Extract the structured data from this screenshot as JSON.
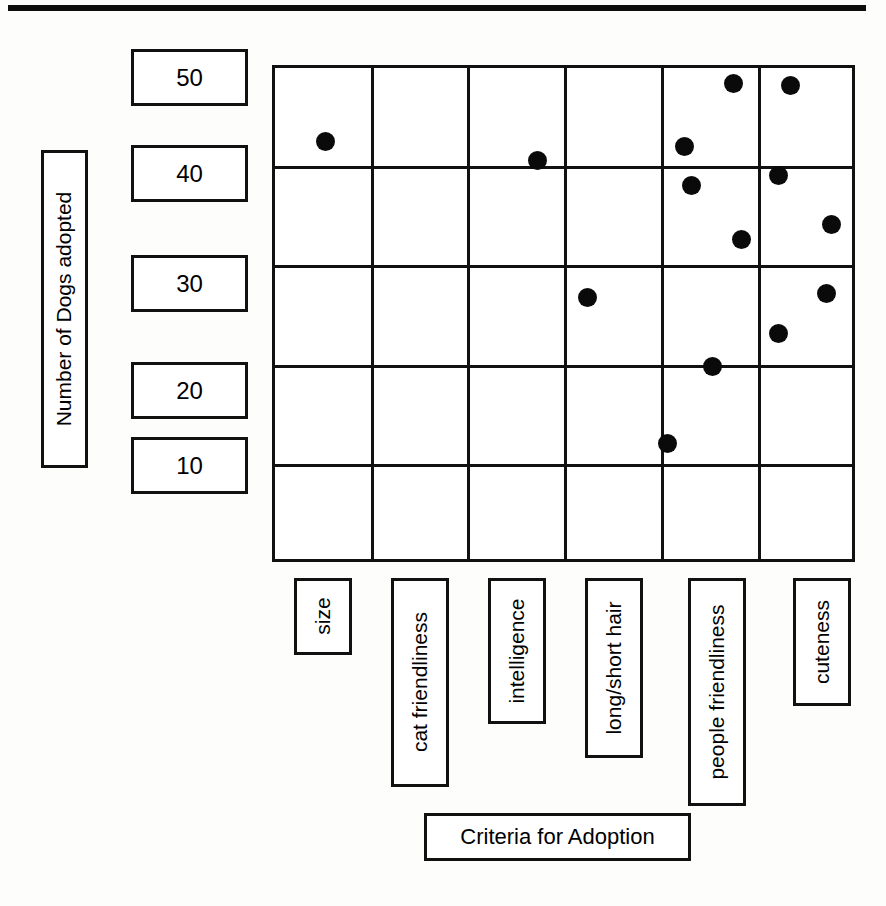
{
  "page": {
    "background_color": "#fdfdfc",
    "ink_color": "#111111"
  },
  "chart_data": {
    "type": "scatter",
    "title": "",
    "xlabel": "Criteria for Adoption",
    "ylabel": "Number of Dogs adopted",
    "categories": [
      "size",
      "cat friendliness",
      "intelligence",
      "long/short hair",
      "people friendliness",
      "cuteness"
    ],
    "ytick_labels": [
      "50",
      "40",
      "30",
      "20",
      "10"
    ],
    "ytick_values": [
      50,
      40,
      30,
      20,
      10
    ],
    "ylim": [
      0,
      50
    ],
    "grid": true,
    "grid_columns": 6,
    "grid_rows": 5,
    "legend": "none",
    "marker": {
      "shape": "circle",
      "color": "#0a0a0a",
      "size_px": 19
    },
    "points": [
      {
        "category": "size",
        "value": 44
      },
      {
        "category": "intelligence",
        "value": 41
      },
      {
        "category": "long/short hair",
        "value": 27
      },
      {
        "category": "long/short hair",
        "value": 12
      },
      {
        "category": "people friendliness",
        "value": 49
      },
      {
        "category": "people friendliness",
        "value": 42
      },
      {
        "category": "people friendliness",
        "value": 38
      },
      {
        "category": "people friendliness",
        "value": 33
      },
      {
        "category": "people friendliness",
        "value": 20
      },
      {
        "category": "cuteness",
        "value": 48
      },
      {
        "category": "cuteness",
        "value": 39
      },
      {
        "category": "cuteness",
        "value": 34
      },
      {
        "category": "cuteness",
        "value": 27
      },
      {
        "category": "cuteness",
        "value": 23
      }
    ],
    "points_pixels": [
      {
        "x": 322,
        "y": 138
      },
      {
        "x": 534,
        "y": 157
      },
      {
        "x": 584,
        "y": 294
      },
      {
        "x": 664,
        "y": 440
      },
      {
        "x": 730,
        "y": 80
      },
      {
        "x": 681,
        "y": 143
      },
      {
        "x": 688,
        "y": 182
      },
      {
        "x": 738,
        "y": 236
      },
      {
        "x": 709,
        "y": 363
      },
      {
        "x": 787,
        "y": 82
      },
      {
        "x": 775,
        "y": 172
      },
      {
        "x": 828,
        "y": 221
      },
      {
        "x": 823,
        "y": 290
      },
      {
        "x": 775,
        "y": 330
      }
    ],
    "grid_geometry": {
      "left": 272,
      "top": 65,
      "right": 855,
      "bottom": 562,
      "vlines": [
        272,
        369,
        465,
        562,
        659,
        756,
        855
      ],
      "hlines": [
        65,
        164,
        263,
        363,
        462,
        562
      ]
    }
  }
}
